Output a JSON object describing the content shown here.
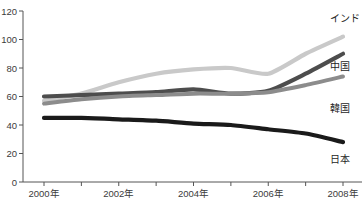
{
  "chart_data": {
    "type": "line",
    "title": "",
    "xlabel": "",
    "ylabel": "",
    "grid": false,
    "legend_position": "right-inline",
    "ylim": [
      0,
      120
    ],
    "yticks": [
      0,
      20,
      40,
      60,
      80,
      100,
      120
    ],
    "ytick_labels": [
      "0",
      "20",
      "40",
      "60",
      "80",
      "100",
      "120"
    ],
    "x": [
      2000,
      2001,
      2002,
      2003,
      2004,
      2005,
      2006,
      2007,
      2008
    ],
    "xtick_labels": [
      "2000年",
      "",
      "2002年",
      "",
      "2004年",
      "",
      "2006年",
      "",
      "2008年"
    ],
    "xtick_labels_shown": [
      "2000年",
      "2002年",
      "2004年",
      "2006年",
      "2008年"
    ],
    "series": [
      {
        "name": "インド",
        "color": "#c9c9c9",
        "values": [
          57,
          62,
          70,
          76,
          79,
          80,
          76,
          90,
          102
        ]
      },
      {
        "name": "中国",
        "color": "#4d4d4d",
        "values": [
          60,
          61,
          62,
          63,
          65,
          62,
          64,
          76,
          90
        ]
      },
      {
        "name": "韓国",
        "color": "#8c8c8c",
        "values": [
          55,
          58,
          60,
          61,
          62,
          62,
          63,
          68,
          74
        ]
      },
      {
        "name": "日本",
        "color": "#1a1a1a",
        "values": [
          45,
          45,
          44,
          43,
          41,
          40,
          37,
          34,
          28
        ]
      }
    ]
  },
  "axis": {
    "y_label_color": "#3b3b3b",
    "axis_color": "#555555"
  }
}
